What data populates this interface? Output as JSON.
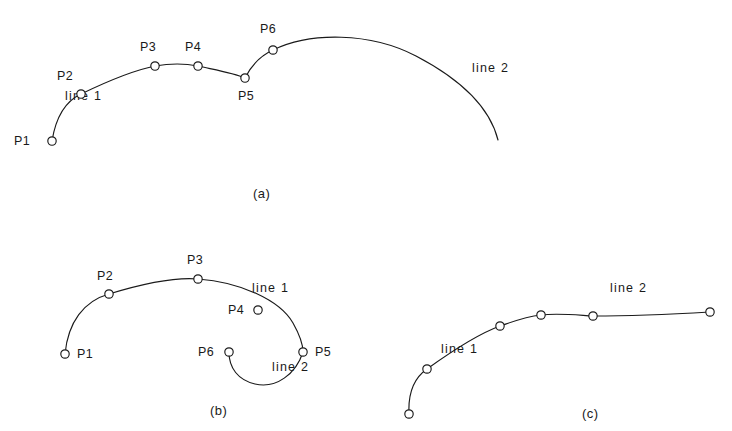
{
  "figure": {
    "background_color": "#ffffff",
    "stroke_color": "#1a1a1a",
    "panels": [
      {
        "id": "a",
        "panel_label": "(a)",
        "panel_label_pos": [
          253,
          198
        ],
        "description": "Two curves joined end to end at P5; line 1 runs P1 to P5, line 2 runs P6 to right end",
        "curves": [
          {
            "name": "line 1",
            "label": "line 1",
            "label_pos": [
              65,
              100
            ],
            "path": "M 52,141 C 56,116 66,101 81,94 C 110,80 135,70 155,66 C 172,63 188,64 198,66 C 216,70 234,73 245,78"
          },
          {
            "name": "line 2",
            "label": "line 2",
            "label_pos": [
              472,
              72
            ],
            "path": "M 245,78 C 252,64 262,55 273,50 C 310,32 370,32 416,56 C 462,80 490,108 498,140"
          }
        ],
        "points": [
          {
            "id": "P1",
            "label": "P1",
            "x": 52,
            "y": 141,
            "label_x": 14,
            "label_y": 145
          },
          {
            "id": "P2",
            "label": "P2",
            "x": 81,
            "y": 94,
            "label_x": 57,
            "label_y": 80
          },
          {
            "id": "P3",
            "label": "P3",
            "x": 155,
            "y": 66,
            "label_x": 140,
            "label_y": 51
          },
          {
            "id": "P4",
            "label": "P4",
            "x": 198,
            "y": 66,
            "label_x": 185,
            "label_y": 51
          },
          {
            "id": "P5",
            "label": "P5",
            "x": 245,
            "y": 78,
            "label_x": 238,
            "label_y": 100
          },
          {
            "id": "P6",
            "label": "P6",
            "x": 273,
            "y": 50,
            "label_x": 260,
            "label_y": 33
          }
        ]
      },
      {
        "id": "b",
        "panel_label": "(b)",
        "panel_label_pos": [
          210,
          415
        ],
        "description": "Line 1 is a large arc P1 to P5 curling back; line 2 is a U shaped arc from P6 up to P5; P4 lies off the curve",
        "curves": [
          {
            "name": "line 1",
            "label": "line 1",
            "label_pos": [
              252,
              292
            ],
            "path": "M 65,354 C 68,322 84,301 109,294 C 145,283 175,277 198,279 C 240,282 280,300 293,323 C 302,339 303,348 303,352"
          },
          {
            "name": "line 2",
            "label": "line 2",
            "label_pos": [
              272,
              371
            ],
            "path": "M 229,352 C 229,368 238,380 255,384 C 276,389 296,374 303,352"
          }
        ],
        "points": [
          {
            "id": "P1",
            "label": "P1",
            "x": 65,
            "y": 354,
            "label_x": 77,
            "label_y": 358
          },
          {
            "id": "P2",
            "label": "P2",
            "x": 109,
            "y": 294,
            "label_x": 97,
            "label_y": 280
          },
          {
            "id": "P3",
            "label": "P3",
            "x": 198,
            "y": 279,
            "label_x": 187,
            "label_y": 264
          },
          {
            "id": "P4",
            "label": "P4",
            "x": 258,
            "y": 310,
            "label_x": 228,
            "label_y": 314
          },
          {
            "id": "P5",
            "label": "P5",
            "x": 303,
            "y": 352,
            "label_x": 315,
            "label_y": 356
          },
          {
            "id": "P6",
            "label": "P6",
            "x": 229,
            "y": 352,
            "label_x": 198,
            "label_y": 356
          }
        ]
      },
      {
        "id": "c",
        "panel_label": "(c)",
        "panel_label_pos": [
          582,
          418
        ],
        "description": "A single smooth merged curve rising from lower left and flattening to the right; six unlabeled nodes",
        "curves": [
          {
            "name": "line 1",
            "label": "line 1",
            "label_pos": [
              441,
              353
            ],
            "path": "M 409,414 C 408,394 414,378 427,369 C 452,351 478,334 500,326 C 512,322 524,317 541,315"
          },
          {
            "name": "line 2",
            "label": "line 2",
            "label_pos": [
              610,
              292
            ],
            "path": "M 541,315 C 558,313 576,315 593,316 C 632,316 676,314 710,312"
          }
        ],
        "points": [
          {
            "id": "C1",
            "label": "",
            "x": 409,
            "y": 414,
            "label_x": 0,
            "label_y": 0
          },
          {
            "id": "C2",
            "label": "",
            "x": 427,
            "y": 369,
            "label_x": 0,
            "label_y": 0
          },
          {
            "id": "C3",
            "label": "",
            "x": 500,
            "y": 326,
            "label_x": 0,
            "label_y": 0
          },
          {
            "id": "C4",
            "label": "",
            "x": 541,
            "y": 315,
            "label_x": 0,
            "label_y": 0
          },
          {
            "id": "C5",
            "label": "",
            "x": 593,
            "y": 316,
            "label_x": 0,
            "label_y": 0
          },
          {
            "id": "C6",
            "label": "",
            "x": 710,
            "y": 312,
            "label_x": 0,
            "label_y": 0
          }
        ]
      }
    ]
  }
}
